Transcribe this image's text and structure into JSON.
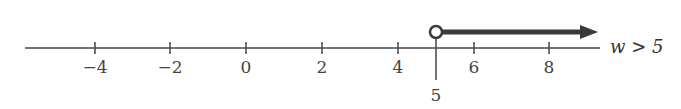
{
  "number_line": {
    "min": -5.8,
    "max": 9.2,
    "ticks": [
      {
        "value": -4,
        "label": "−4"
      },
      {
        "value": -2,
        "label": "−2"
      },
      {
        "value": 0,
        "label": "0"
      },
      {
        "value": 2,
        "label": "2"
      },
      {
        "value": 4,
        "label": "4"
      },
      {
        "value": 6,
        "label": "6"
      },
      {
        "value": 8,
        "label": "8"
      }
    ],
    "highlight_tick": {
      "value": 5,
      "label": "5"
    },
    "endpoint": {
      "value": 5,
      "type": "open"
    },
    "ray_direction": "right",
    "inequality_label": "w > 5"
  },
  "colors": {
    "axis": "#444444",
    "ray": "#3a3a3a",
    "text": "#444444"
  }
}
